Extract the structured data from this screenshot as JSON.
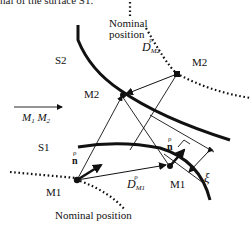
{
  "caption": "nal of the surface S1.",
  "labels": {
    "nominal_top_line1": "Nominal",
    "nominal_top_line2": "position",
    "nominal_bottom": "Nominal position",
    "s2": "S2",
    "s1": "S1",
    "m2_actual": "M2",
    "m2_nominal": "M2",
    "m1_actual": "M1",
    "m1_nominal": "M1",
    "m1m2_vector": "M",
    "m1m2_sub1": "1",
    "m1m2_mid": " M",
    "m1m2_sub2": "2",
    "d_m2_accent": "ρ",
    "d_m2_main": "D",
    "d_m2_sub": "M2",
    "d_m1_accent": "ρ",
    "d_m1_main": "D",
    "d_m1_sub": "M1",
    "n_left_accent": "ρ",
    "n_left_main": "n",
    "n_right_accent": "ρ",
    "n_right_main": "n",
    "xi": "ξ"
  },
  "colors": {
    "stroke": "#111111",
    "background": "#ffffff"
  }
}
